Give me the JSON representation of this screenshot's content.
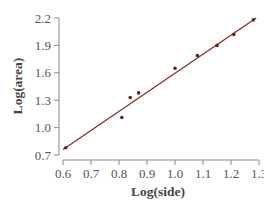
{
  "chart_data": {
    "type": "scatter",
    "title": "",
    "xlabel": "Log(side)",
    "ylabel": "Log(area)",
    "xlim": [
      0.6,
      1.3
    ],
    "ylim": [
      0.7,
      2.2
    ],
    "x_ticks": [
      "0.6",
      "0.7",
      "0.8",
      "0.9",
      "1.0",
      "1.1",
      "1.2",
      "1.3"
    ],
    "y_ticks": [
      "0.7",
      "1.0",
      "1.3",
      "1.6",
      "1.9",
      "2.2"
    ],
    "grid": false,
    "legend": null,
    "series": [
      {
        "name": "data",
        "points": [
          {
            "x": 0.61,
            "y": 0.78
          },
          {
            "x": 0.81,
            "y": 1.11
          },
          {
            "x": 0.84,
            "y": 1.33
          },
          {
            "x": 0.87,
            "y": 1.38
          },
          {
            "x": 1.0,
            "y": 1.65
          },
          {
            "x": 1.08,
            "y": 1.79
          },
          {
            "x": 1.15,
            "y": 1.9
          },
          {
            "x": 1.21,
            "y": 2.02
          },
          {
            "x": 1.28,
            "y": 2.18
          }
        ]
      }
    ],
    "fit_line": {
      "x0": 0.6,
      "y0": 0.76,
      "x1": 1.29,
      "y1": 2.2,
      "color": "#8b2c2c"
    },
    "colors": {
      "points": "#6b1e1e",
      "line": "#8b2c2c",
      "axis": "#888888"
    }
  }
}
